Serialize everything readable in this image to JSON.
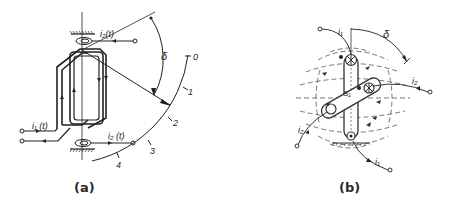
{
  "figure": {
    "panel_a": {
      "caption": "(a)",
      "labels": {
        "current_i1": "i₁ (t)",
        "current_i2_top": "i₂(t)",
        "current_i2_bottom": "i₂ (t)",
        "angle": "δ",
        "scale_0": "0",
        "scale_1": "1",
        "scale_2": "2",
        "scale_3": "3",
        "scale_4": "4"
      }
    },
    "panel_b": {
      "caption": "(b)",
      "labels": {
        "current_i1_top": "i₁",
        "current_i1_bottom": "i₁",
        "current_i2_right": "i₂",
        "current_i2_left": "i₂",
        "angle": "δ",
        "center": "S₁"
      }
    }
  }
}
